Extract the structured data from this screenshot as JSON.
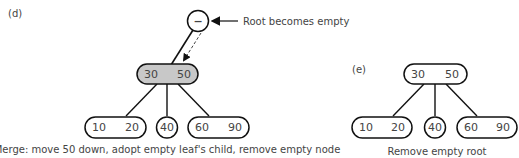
{
  "panel_d": {
    "label": "(d)",
    "root": {
      "symbol": "−",
      "annotation": "Root becomes empty"
    },
    "internal": {
      "keys": [
        "30",
        "50"
      ],
      "fill": "#c8c8c8"
    },
    "leaves": [
      {
        "keys": [
          "10",
          "20"
        ]
      },
      {
        "keys": [
          "40"
        ]
      },
      {
        "keys": [
          "60",
          "90"
        ]
      }
    ],
    "caption": "Merge: move 50 down, adopt empty leaf's child, remove empty node"
  },
  "panel_e": {
    "label": "(e)",
    "root": {
      "keys": [
        "30",
        "50"
      ]
    },
    "leaves": [
      {
        "keys": [
          "10",
          "20"
        ]
      },
      {
        "keys": [
          "40"
        ]
      },
      {
        "keys": [
          "60",
          "90"
        ]
      }
    ],
    "caption": "Remove empty root"
  }
}
